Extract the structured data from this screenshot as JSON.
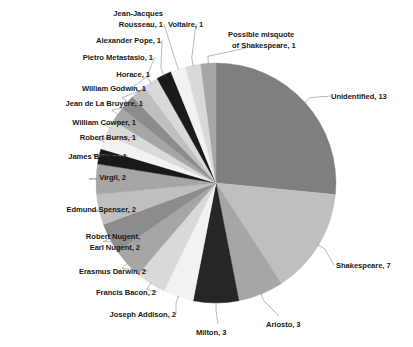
{
  "chart_data": {
    "type": "pie",
    "title": "",
    "subtitle": "",
    "xlabel": "",
    "ylabel": "",
    "legend_position": "none",
    "labels_position": "outside-with-leader-lines",
    "grid": false,
    "total": 49,
    "start_angle_deg": 0,
    "direction": "clockwise",
    "categories": [
      "Unidentified",
      "Shakespeare",
      "Ariosto",
      "Milton",
      "Joseph Addison",
      "Francis Bacon",
      "Erasmus Darwin",
      "Robert Nugent, Earl Nugent",
      "Edmund Spenser",
      "Virgil",
      "James Beattie",
      "Robert Burns",
      "William Cowper",
      "Jean de La Bruyère",
      "William Godwin",
      "Horace",
      "Pietro Metastasio",
      "Alexander Pope",
      "Jean-Jacques Rousseau",
      "Voltaire",
      "Possible misquote of Shakespeare"
    ],
    "values": [
      13,
      7,
      3,
      3,
      2,
      2,
      2,
      2,
      2,
      2,
      1,
      1,
      1,
      1,
      1,
      1,
      1,
      1,
      1,
      1,
      1
    ],
    "colors": [
      "#7f7f7f",
      "#bfbfbf",
      "#a6a6a6",
      "#262626",
      "#f2f2f2",
      "#d9d9d9",
      "#a6a6a6",
      "#8c8c8c",
      "#bfbfbf",
      "#a6a6a6",
      "#191919",
      "#f2f2f2",
      "#d9d9d9",
      "#a6a6a6",
      "#8c8c8c",
      "#bfbfbf",
      "#d9d9d9",
      "#1a1a1a",
      "#f2f2f2",
      "#d9d9d9",
      "#a6a6a6"
    ]
  },
  "labels": [
    {
      "id": "unidentified",
      "lines": [
        "Unidentified, 13"
      ]
    },
    {
      "id": "shakespeare",
      "lines": [
        "Shakespeare, 7"
      ]
    },
    {
      "id": "ariosto",
      "lines": [
        "Ariosto, 3"
      ]
    },
    {
      "id": "milton",
      "lines": [
        "Milton, 3"
      ]
    },
    {
      "id": "joseph-addison",
      "lines": [
        "Joseph Addison, 2"
      ]
    },
    {
      "id": "francis-bacon",
      "lines": [
        "Francis Bacon, 2"
      ]
    },
    {
      "id": "erasmus-darwin",
      "lines": [
        "Erasmus Darwin, 2"
      ]
    },
    {
      "id": "robert-nugent",
      "lines": [
        "Robert Nugent,",
        "Earl Nugent, 2"
      ]
    },
    {
      "id": "edmund-spenser",
      "lines": [
        "Edmund Spenser, 2"
      ]
    },
    {
      "id": "virgil",
      "lines": [
        "Virgil, 2"
      ]
    },
    {
      "id": "james-beattie",
      "lines": [
        "James Beattie, 1"
      ]
    },
    {
      "id": "robert-burns",
      "lines": [
        "Robert Burns, 1"
      ]
    },
    {
      "id": "william-cowper",
      "lines": [
        "William Cowper, 1"
      ]
    },
    {
      "id": "jean-de-la-bruyere",
      "lines": [
        "Jean de La Bruyère, 1"
      ]
    },
    {
      "id": "william-godwin",
      "lines": [
        "William Godwin, 1"
      ]
    },
    {
      "id": "horace",
      "lines": [
        "Horace, 1"
      ]
    },
    {
      "id": "pietro-metastasio",
      "lines": [
        "Pietro Metastasio, 1"
      ]
    },
    {
      "id": "alexander-pope",
      "lines": [
        "Alexander Pope, 1"
      ]
    },
    {
      "id": "jean-jacques-rousseau",
      "lines": [
        "Jean-Jacques",
        "Rousseau, 1"
      ]
    },
    {
      "id": "voltaire",
      "lines": [
        "Voltaire, 1"
      ]
    },
    {
      "id": "possible-misquote",
      "lines": [
        "Possible misquote",
        "of Shakespeare, 1"
      ]
    }
  ],
  "label_text": {
    "unidentified": "Unidentified, 13",
    "shakespeare": "Shakespeare, 7",
    "ariosto": "Ariosto, 3",
    "milton": "Milton, 3",
    "joseph_addison": "Joseph Addison, 2",
    "francis_bacon": "Francis Bacon, 2",
    "erasmus_darwin": "Erasmus Darwin, 2",
    "robert_nugent_l1": "Robert Nugent,",
    "robert_nugent_l2": "Earl Nugent, 2",
    "edmund_spenser": "Edmund Spenser, 2",
    "virgil": "Virgil, 2",
    "james_beattie": "James Beattie, 1",
    "robert_burns": "Robert Burns, 1",
    "william_cowper": "William Cowper, 1",
    "jean_de_la_bruyere": "Jean de La Bruyère, 1",
    "william_godwin": "William Godwin, 1",
    "horace": "Horace, 1",
    "pietro_metastasio": "Pietro Metastasio, 1",
    "alexander_pope": "Alexander Pope, 1",
    "rousseau_l1": "Jean-Jacques",
    "rousseau_l2": "Rousseau, 1",
    "voltaire": "Voltaire, 1",
    "misquote_l1": "Possible misquote",
    "misquote_l2": "of Shakespeare, 1"
  },
  "geometry": {
    "center_x": 216,
    "center_y": 183,
    "radius": 120,
    "leader_color": "#9a9a9a"
  }
}
